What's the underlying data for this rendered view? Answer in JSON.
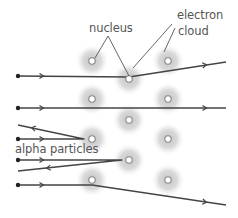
{
  "labels": {
    "nucleus": "nucleus",
    "electron_cloud_line1": "electron",
    "electron_cloud_line2": "cloud",
    "alpha_particles": "alpha particles"
  },
  "colors": {
    "line": "#444444",
    "cloud": "#c8c8c8",
    "nucleus_ring": "#888888",
    "text": "#555555"
  },
  "atoms": [
    {
      "x": 92,
      "y": 61
    },
    {
      "x": 168,
      "y": 61
    },
    {
      "x": 129,
      "y": 79
    },
    {
      "x": 92,
      "y": 99
    },
    {
      "x": 168,
      "y": 99
    },
    {
      "x": 129,
      "y": 120
    },
    {
      "x": 92,
      "y": 139
    },
    {
      "x": 168,
      "y": 139
    },
    {
      "x": 129,
      "y": 160
    },
    {
      "x": 92,
      "y": 180
    },
    {
      "x": 168,
      "y": 180
    }
  ],
  "paths": [
    {
      "name": "deflected-slightly-up",
      "points": [
        [
          18,
          76
        ],
        [
          129,
          77
        ],
        [
          226,
          62
        ]
      ],
      "arrows": [
        [
          42,
          76
        ],
        [
          205,
          65
        ]
      ]
    },
    {
      "name": "straight-through",
      "points": [
        [
          18,
          108
        ],
        [
          226,
          108
        ]
      ],
      "arrows": [
        [
          42,
          108
        ],
        [
          205,
          108
        ]
      ]
    },
    {
      "name": "reflected-back-upper",
      "points": [
        [
          18,
          139
        ],
        [
          84,
          139
        ],
        [
          18,
          125
        ]
      ],
      "arrows": [
        [
          42,
          139
        ],
        [
          33,
          128
        ]
      ]
    },
    {
      "name": "reflected-back-lower",
      "points": [
        [
          18,
          160
        ],
        [
          122,
          160
        ],
        [
          18,
          171
        ]
      ],
      "arrows": [
        [
          42,
          160
        ],
        [
          48,
          168
        ]
      ]
    },
    {
      "name": "deflected-down",
      "points": [
        [
          18,
          185
        ],
        [
          92,
          185
        ],
        [
          226,
          205
        ]
      ],
      "arrows": [
        [
          42,
          185
        ],
        [
          205,
          202
        ]
      ]
    }
  ],
  "pointers": [
    {
      "from": [
        108,
        36
      ],
      "to": [
        95,
        58
      ]
    },
    {
      "from": [
        108,
        36
      ],
      "to": [
        129,
        76
      ]
    },
    {
      "from": [
        172,
        24
      ],
      "to": [
        133,
        68
      ]
    },
    {
      "from": [
        175,
        28
      ],
      "to": [
        164,
        52
      ]
    }
  ]
}
